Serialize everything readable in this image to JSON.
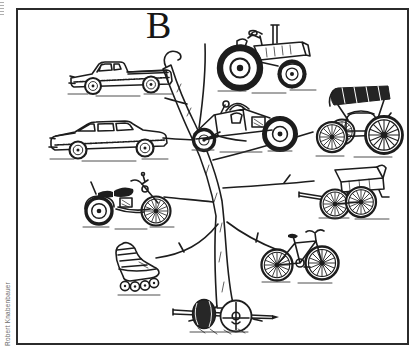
{
  "figure": {
    "label": "B",
    "credit": "Robert Knabenbauer",
    "subject": "Hand-drawn tree with vehicles on its branches",
    "tree_label": "Branching tree",
    "ink_color": "#1d1d1d",
    "paper_color": "#ffffff",
    "frame_color": "#2b2b2b",
    "vehicles": [
      {
        "id": "pickup-truck",
        "label": "Pickup truck"
      },
      {
        "id": "tractor",
        "label": "Farm tractor"
      },
      {
        "id": "sedan",
        "label": "Sedan car"
      },
      {
        "id": "dune-buggy",
        "label": "Dune buggy"
      },
      {
        "id": "horseless-carriage",
        "label": "Horseless carriage"
      },
      {
        "id": "motorcycle",
        "label": "Motorcycle"
      },
      {
        "id": "hand-cart",
        "label": "Two-wheeled cart"
      },
      {
        "id": "inline-skate",
        "label": "In-line skate"
      },
      {
        "id": "bicycle",
        "label": "Bicycle"
      },
      {
        "id": "wheel-and-axle",
        "label": "Wheel and axle"
      }
    ]
  }
}
